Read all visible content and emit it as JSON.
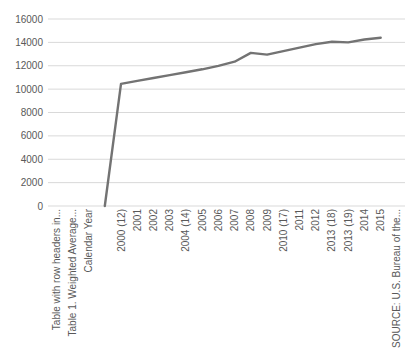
{
  "chart_data": {
    "type": "line",
    "title": "",
    "xlabel": "",
    "ylabel": "",
    "categories": [
      "Table with row headers in...",
      "Table 1. Weighted Average...",
      "Calendar Year",
      "",
      "2000 (12)",
      "2001",
      "2002",
      "2003",
      "2004 (14)",
      "2005",
      "2006",
      "2007",
      "2008",
      "2009",
      "2010 (17)",
      "2011",
      "2012",
      "2013 (18)",
      "2013 (19)",
      "2014",
      "2015",
      "SOURCE: U.S. Bureau of the..."
    ],
    "series": [
      {
        "name": "series-1",
        "values": [
          null,
          null,
          null,
          0,
          10450,
          10700,
          10950,
          11200,
          11450,
          11700,
          12000,
          12350,
          13100,
          12950,
          13250,
          13550,
          13850,
          14050,
          14000,
          14250,
          14400,
          null
        ]
      }
    ],
    "ylim": [
      0,
      16000
    ],
    "ytick_step": 2000,
    "yticks": [
      "0",
      "2000",
      "4000",
      "6000",
      "8000",
      "10000",
      "12000",
      "14000",
      "16000"
    ],
    "grid": true,
    "legend": "none",
    "colors": {
      "line": "#737373",
      "gridline": "#d9d9d9",
      "tick_label": "#595959",
      "background": "#ffffff"
    }
  }
}
